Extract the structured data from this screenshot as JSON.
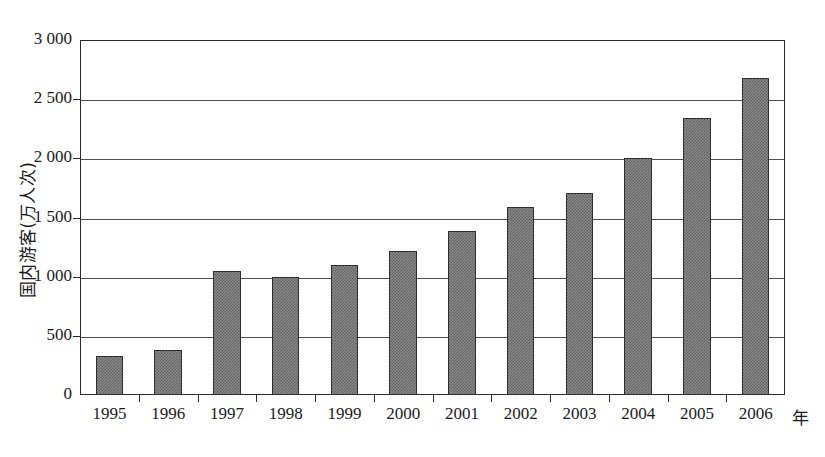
{
  "chart_data": {
    "type": "bar",
    "title": "",
    "xlabel": "年",
    "ylabel": "国内游客(万人次)",
    "categories": [
      "1995",
      "1996",
      "1997",
      "1998",
      "1999",
      "2000",
      "2001",
      "2002",
      "2003",
      "2004",
      "2005",
      "2006"
    ],
    "values": [
      330,
      380,
      1050,
      1000,
      1100,
      1220,
      1390,
      1590,
      1710,
      2000,
      2340,
      2680
    ],
    "ylim": [
      0,
      3000
    ],
    "ytick_labels": [
      "3 000",
      "2 500",
      "2 000",
      "1 500",
      "1 000",
      "500",
      "0"
    ],
    "ytick_values": [
      3000,
      2500,
      2000,
      1500,
      1000,
      500,
      0
    ],
    "grid": true,
    "legend": "none",
    "series_name": "国内游客",
    "bar_fill_color": "#8a8a8a",
    "bar_border_color": "#2e2e2e",
    "axis_color": "#2b2b2b",
    "grid_color": "#4d4d4d",
    "background_color": "#ffffff"
  }
}
